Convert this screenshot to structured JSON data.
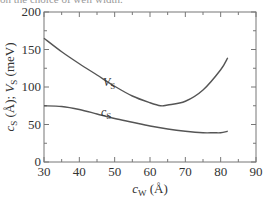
{
  "caption_fragment": "on the choice of well width.",
  "chart_data": {
    "type": "line",
    "title": "",
    "xlabel": "c_W (Å)",
    "ylabel": "c_s (Å); V_s (meV)",
    "xlim": [
      30,
      90
    ],
    "ylim": [
      0,
      200
    ],
    "xticks": [
      30,
      40,
      50,
      60,
      70,
      80,
      90
    ],
    "yticks": [
      0,
      50,
      100,
      150,
      200
    ],
    "grid": false,
    "legend": "inline labels on curves",
    "series": [
      {
        "name": "V_s",
        "unit": "meV",
        "x": [
          30,
          35,
          40,
          45,
          50,
          55,
          60,
          63,
          65,
          70,
          75,
          80,
          82
        ],
        "values": [
          165,
          147,
          131,
          116,
          101,
          88,
          79,
          75,
          76,
          81,
          96,
          123,
          139
        ]
      },
      {
        "name": "c_s",
        "unit": "Å",
        "x": [
          30,
          35,
          40,
          45,
          50,
          55,
          60,
          65,
          70,
          75,
          78,
          80,
          82
        ],
        "values": [
          75,
          74,
          70,
          64,
          58,
          53,
          48,
          44,
          41,
          39,
          39,
          39,
          41
        ]
      }
    ]
  },
  "labels": {
    "x_axis_main": "c",
    "x_axis_sub": "W",
    "x_axis_unit": " (Å)",
    "y_axis_c": "c",
    "y_axis_c_sub": "S",
    "y_axis_mid": " (Å); ",
    "y_axis_v": "V",
    "y_axis_v_sub": "S",
    "y_axis_unit": " (meV)",
    "vs_main": "V",
    "vs_sub": "S",
    "cs_main": "c",
    "cs_sub": "S"
  }
}
